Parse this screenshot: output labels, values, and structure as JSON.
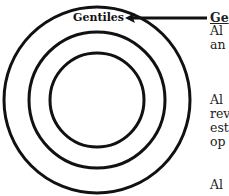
{
  "diagram": {
    "circles": [
      {
        "name": "outer",
        "cx": 97,
        "cy": 100,
        "r": 93
      },
      {
        "name": "middle",
        "cx": 97,
        "cy": 100,
        "r": 68
      },
      {
        "name": "inner",
        "cx": 97,
        "cy": 100,
        "r": 47
      }
    ],
    "stroke_color": "#111111",
    "outer_label": "Gentiles"
  },
  "annotation": {
    "heading": "Ge",
    "lines": [
      "Al",
      "an",
      "Al",
      "rev",
      "est",
      "op",
      "Al"
    ]
  }
}
